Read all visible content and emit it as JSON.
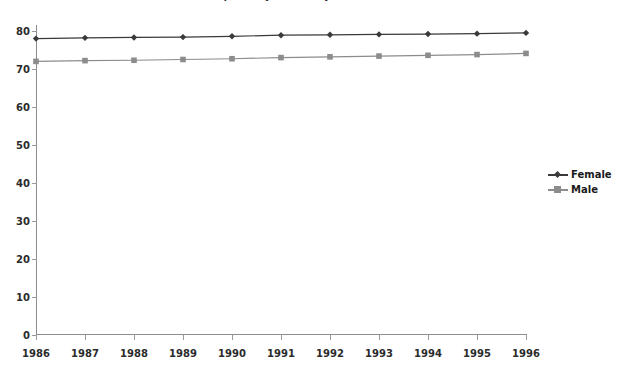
{
  "chart_data": {
    "type": "line",
    "title": "Life expectancy at birth by sex",
    "xlabel": "",
    "ylabel": "",
    "categories": [
      "1986",
      "1987",
      "1988",
      "1989",
      "1990",
      "1991",
      "1992",
      "1993",
      "1994",
      "1995",
      "1996"
    ],
    "x": [
      1986,
      1987,
      1988,
      1989,
      1990,
      1991,
      1992,
      1993,
      1994,
      1995,
      1996
    ],
    "series": [
      {
        "name": "Female",
        "color": "#3a3a3a",
        "marker": "diamond",
        "values": [
          78.0,
          78.2,
          78.3,
          78.4,
          78.6,
          78.9,
          79.0,
          79.1,
          79.2,
          79.3,
          79.5
        ]
      },
      {
        "name": "Male",
        "color": "#8c8c8c",
        "marker": "square",
        "values": [
          72.0,
          72.2,
          72.3,
          72.5,
          72.7,
          73.0,
          73.2,
          73.4,
          73.6,
          73.8,
          74.1
        ]
      }
    ],
    "ylim": [
      0,
      80
    ],
    "yticks": [
      0,
      10,
      20,
      30,
      40,
      50,
      60,
      70,
      80
    ],
    "ytick_labels": [
      "0",
      "10",
      "20",
      "30",
      "40",
      "50",
      "60",
      "70",
      "80"
    ],
    "grid": false,
    "legend_position": "right",
    "axis_color": "#8d8d8d",
    "background": "#ffffff"
  },
  "legend": {
    "entries": [
      {
        "label": "Female"
      },
      {
        "label": "Male"
      }
    ]
  }
}
